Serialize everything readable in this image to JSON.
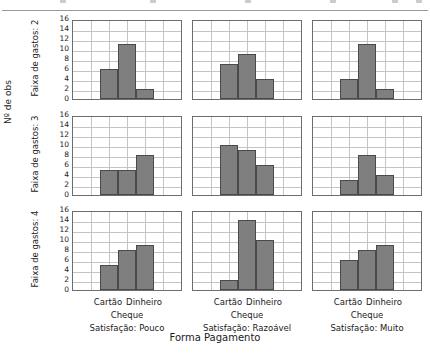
{
  "chart_data": {
    "type": "bar",
    "title": "",
    "subtitle": "",
    "xlabel": "Forma Pagamento",
    "ylabel": "Nº de obs",
    "categories": [
      "Cartão",
      "Cheque",
      "Dinheiro"
    ],
    "visible_tick_labels": [
      "Cartão",
      "Dinheiro"
    ],
    "second_line_tick_label": "Cheque",
    "ylim": [
      0,
      16
    ],
    "yticks": [
      0,
      2,
      4,
      6,
      8,
      10,
      12,
      14,
      16
    ],
    "grid": true,
    "legend": "none",
    "layout": "trellis 3 rows x 3 columns",
    "row_strips": [
      "Faixa de gastos: 2",
      "Faixa de gastos: 3",
      "Faixa de gastos: 4"
    ],
    "column_captions": [
      "Satisfação: Pouco",
      "Satisfação: Razoável",
      "Satisfação: Muito"
    ],
    "panels": [
      {
        "row": "Faixa de gastos: 2",
        "col": "Satisfação: Pouco",
        "values": [
          6,
          11,
          2
        ]
      },
      {
        "row": "Faixa de gastos: 2",
        "col": "Satisfação: Razoável",
        "values": [
          7,
          9,
          4
        ]
      },
      {
        "row": "Faixa de gastos: 2",
        "col": "Satisfação: Muito",
        "values": [
          4,
          11,
          2
        ]
      },
      {
        "row": "Faixa de gastos: 3",
        "col": "Satisfação: Pouco",
        "values": [
          5,
          5,
          8
        ]
      },
      {
        "row": "Faixa de gastos: 3",
        "col": "Satisfação: Razoável",
        "values": [
          10,
          9,
          6
        ]
      },
      {
        "row": "Faixa de gastos: 3",
        "col": "Satisfação: Muito",
        "values": [
          3,
          8,
          4
        ]
      },
      {
        "row": "Faixa de gastos: 4",
        "col": "Satisfação: Pouco",
        "values": [
          5,
          8,
          9
        ]
      },
      {
        "row": "Faixa de gastos: 4",
        "col": "Satisfação: Razoável",
        "values": [
          2,
          14,
          10
        ]
      },
      {
        "row": "Faixa de gastos: 4",
        "col": "Satisfação: Muito",
        "values": [
          6,
          8,
          9
        ]
      }
    ],
    "colors": {
      "bar_fill": "#7f7f7f",
      "bar_stroke": "#4a4a4a",
      "grid": "#c4c4c4",
      "axis": "#6d6d6d",
      "background": "#ffffff",
      "text": "#1a1a1a"
    }
  }
}
